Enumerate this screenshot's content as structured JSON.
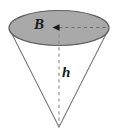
{
  "figure": {
    "name": "cone-volume-diagram",
    "background_color": "#ffffff",
    "labels": {
      "base_area": "B",
      "height": "h"
    },
    "colors": {
      "base_fill": "#a9a9a9",
      "outline": "#6e6e6e",
      "dashed_line": "#8a8a8a",
      "label_text": "#1a1a1a"
    },
    "geometry": {
      "ellipse_center_x": 59,
      "ellipse_center_y": 28,
      "ellipse_radius_x": 50,
      "ellipse_radius_y": 18,
      "apex_x": 59,
      "apex_y": 127,
      "height_line_label": "h",
      "radius_line_label": "B"
    }
  }
}
